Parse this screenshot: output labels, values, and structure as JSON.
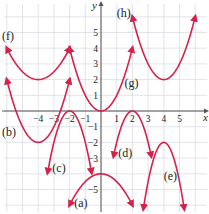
{
  "chart_data": {
    "type": "line",
    "title": "",
    "xlabel": "x",
    "ylabel": "y",
    "xlim": [
      -6.4,
      6.8
    ],
    "ylim": [
      -6.5,
      6.8
    ],
    "grid": true,
    "x_ticks": [
      -4,
      -3,
      -2,
      -1,
      1,
      2,
      3,
      4,
      5
    ],
    "y_ticks": [
      5,
      4,
      3,
      2,
      1,
      -1,
      -2,
      -3,
      -5
    ],
    "curve_color": "#d6224a",
    "series": [
      {
        "name": "(a)",
        "vertex": [
          0,
          -4
        ],
        "a": -0.5,
        "h": 0,
        "k": -4,
        "x_range": [
          -2,
          2
        ],
        "label_pos": [
          -1.7,
          -6.1
        ]
      },
      {
        "name": "(b)",
        "vertex": [
          -4,
          -2
        ],
        "a": 1,
        "h": -4,
        "k": -2,
        "x_range": [
          -6,
          -2
        ],
        "label_pos": [
          -6.3,
          -1.6
        ]
      },
      {
        "name": "(c)",
        "vertex": [
          -2,
          0
        ],
        "a": -2,
        "h": -2,
        "k": 0,
        "x_range": [
          -3.4,
          -0.6
        ],
        "label_pos": [
          -3.1,
          -3.9
        ]
      },
      {
        "name": "(d)",
        "vertex": [
          2,
          0
        ],
        "a": -2,
        "h": 2,
        "k": 0,
        "x_range": [
          0.8,
          3.2
        ],
        "label_pos": [
          1.1,
          -2.9
        ]
      },
      {
        "name": "(e)",
        "vertex": [
          4,
          -2
        ],
        "a": -2.5,
        "h": 4,
        "k": -2,
        "x_range": [
          2.7,
          5.3
        ],
        "label_pos": [
          4.0,
          -4.4
        ]
      },
      {
        "name": "(f)",
        "vertex": [
          -4,
          2
        ],
        "a": 0.5,
        "h": -4,
        "k": 2,
        "x_range": [
          -6,
          -2
        ],
        "label_pos": [
          -6.3,
          4.5
        ]
      },
      {
        "name": "(g)",
        "vertex": [
          0,
          0
        ],
        "a": 1,
        "h": 0,
        "k": 0,
        "x_range": [
          -2,
          2
        ],
        "label_pos": [
          1.5,
          1.5
        ]
      },
      {
        "name": "(h)",
        "vertex": [
          4,
          2
        ],
        "a": 1,
        "h": 4,
        "k": 2,
        "x_range": [
          2,
          6
        ],
        "label_pos": [
          1.0,
          6.0
        ]
      }
    ]
  }
}
